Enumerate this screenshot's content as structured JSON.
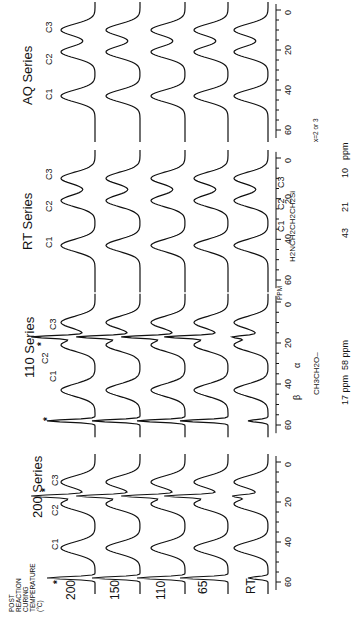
{
  "figure": {
    "caption_left": [
      "POST",
      "REACTION",
      "CURING",
      "TEMPERATURE",
      "(°C)"
    ],
    "row_labels": [
      "200",
      "150",
      "110",
      "65",
      "RT"
    ],
    "axis_unit": "ppm",
    "axis_unit_small": "PPM",
    "axis_ticks": [
      "0",
      "20",
      "40",
      "60"
    ],
    "peak_labels": [
      "C1",
      "C2",
      "C3"
    ],
    "marker": "*",
    "series": [
      {
        "name": "AQ Series"
      },
      {
        "name": "RT Series"
      },
      {
        "name": "110 Series"
      },
      {
        "name": "200 Series"
      }
    ],
    "structure_propyl": {
      "formula": "H2NCH2CH2CH2Si",
      "labels": [
        "C1",
        "C2",
        "C3"
      ],
      "shifts": [
        "43",
        "21",
        "10"
      ],
      "shift_unit": "ppm",
      "note": "x=2 or 3"
    },
    "structure_ethoxy": {
      "formula": "CH3CH2O–",
      "labels": [
        "β",
        "α"
      ],
      "shifts": [
        "17 ppm",
        "58 ppm"
      ]
    }
  },
  "chart_data": {
    "type": "line",
    "xlabel": "ppm",
    "xlim": [
      65,
      -5
    ],
    "x_ticks": [
      0,
      20,
      40,
      60
    ],
    "legend": [
      "200",
      "150",
      "110",
      "65",
      "RT"
    ],
    "panels": [
      {
        "name": "AQ Series",
        "peaks_ppm": {
          "C1": 43,
          "C2": 21,
          "C3": 10
        },
        "series": [
          {
            "name": "200"
          },
          {
            "name": "150"
          },
          {
            "name": "110"
          },
          {
            "name": "65"
          },
          {
            "name": "RT"
          }
        ],
        "sharp_peaks_ppm": []
      },
      {
        "name": "RT Series",
        "peaks_ppm": {
          "C1": 43,
          "C2": 21,
          "C3": 10
        },
        "series": [
          {
            "name": "200"
          },
          {
            "name": "150"
          },
          {
            "name": "110"
          },
          {
            "name": "65"
          },
          {
            "name": "RT"
          }
        ],
        "sharp_peaks_ppm": []
      },
      {
        "name": "110 Series",
        "peaks_ppm": {
          "C1": 43,
          "C2": 21,
          "C3": 10
        },
        "series": [
          {
            "name": "200"
          },
          {
            "name": "150"
          },
          {
            "name": "110"
          },
          {
            "name": "65"
          },
          {
            "name": "RT"
          }
        ],
        "sharp_peaks_ppm": [
          58,
          17
        ]
      },
      {
        "name": "200 Series",
        "peaks_ppm": {
          "C1": 43,
          "C2": 21,
          "C3": 10
        },
        "series": [
          {
            "name": "200"
          },
          {
            "name": "150"
          },
          {
            "name": "110"
          },
          {
            "name": "65"
          },
          {
            "name": "RT"
          }
        ],
        "sharp_peaks_ppm": [
          58,
          17
        ]
      }
    ],
    "annotations": [
      "* ethoxy peaks at 58 ppm (α) and 17 ppm (β)",
      "x=2 or 3"
    ]
  }
}
